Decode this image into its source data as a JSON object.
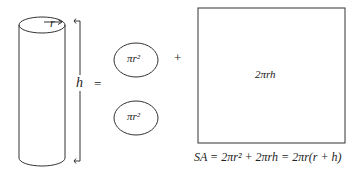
{
  "diagram": {
    "cylinder": {
      "radius_label": "r",
      "height_label": "h"
    },
    "operators": {
      "equals": "=",
      "plus": "+"
    },
    "top_circle": {
      "label": "πr²"
    },
    "bottom_circle": {
      "label": "πr²"
    },
    "lateral_rectangle": {
      "label": "2πrh"
    },
    "formula": "SA = 2πr² + 2πrh = 2πr(r + h)"
  },
  "colors": {
    "stroke": "#333333",
    "background": "#ffffff"
  }
}
